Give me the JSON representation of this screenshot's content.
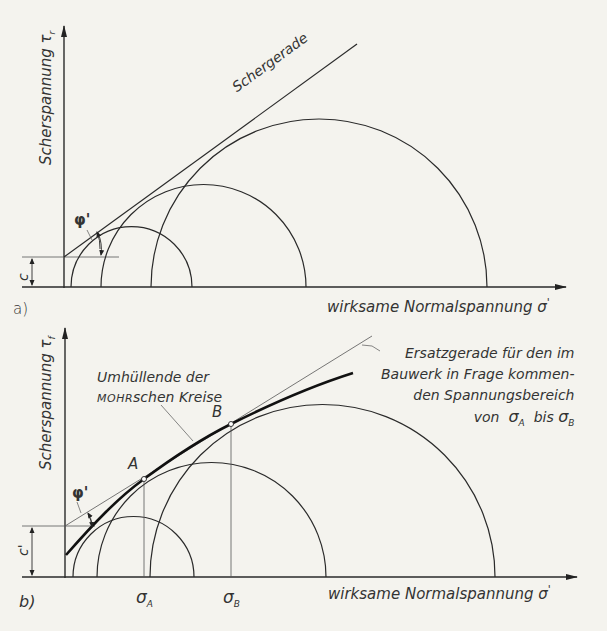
{
  "diagram_a": {
    "panel_label": "a)",
    "y_axis_label": "Scherspannung τ",
    "y_axis_subscript": "r",
    "x_axis_label": "wirksame Normalspannung σ",
    "x_axis_prime": "'",
    "line_label": "Schergerade",
    "angle_label": "φ'",
    "intercept_label": "c"
  },
  "diagram_b": {
    "panel_label": "b)",
    "y_axis_label": "Scherspannung τ",
    "y_axis_subscript": "f",
    "y_axis_prime": "'",
    "x_axis_label": "wirksame Normalspannung σ",
    "x_axis_prime": "'",
    "envelope_label_line1": "Umhüllende der",
    "envelope_label_line2_smallcaps": "Mohr",
    "envelope_label_line2_rest": "schen Kreise",
    "replacement_line_label": [
      "Ersatzgerade für den im",
      "Bauwerk in Frage kommen-",
      "den Spannungsbereich"
    ],
    "range_label_prefix": "von",
    "range_label_mid": "bis",
    "sigma_symbol": "σ",
    "point_a": "A",
    "point_b": "B",
    "sigma_a_sub": "A",
    "sigma_b_sub": "B",
    "angle_label": "φ'",
    "intercept_label": "c'"
  },
  "colors": {
    "background": "#f4f3ee",
    "ink": "#2a2a2a",
    "thin_line": "#555555"
  }
}
